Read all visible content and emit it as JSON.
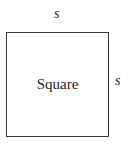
{
  "diagram": {
    "shape": "square",
    "center_label": "Square",
    "side_labels": {
      "top": "s",
      "right": "s"
    },
    "stroke_color": "#3a3a3a",
    "text_color": "#222222"
  }
}
